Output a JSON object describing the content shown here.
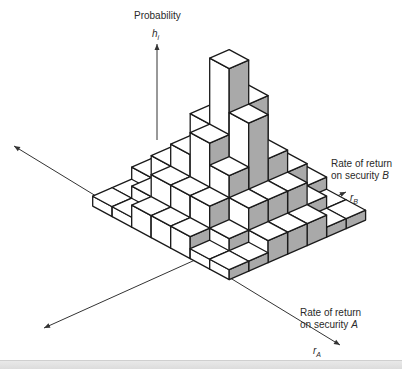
{
  "chart_data": {
    "type": "bar3d",
    "title": "",
    "z_axis": {
      "label": "Probability",
      "symbol": "h",
      "subscript": "i"
    },
    "x_axis": {
      "label_line1": "Rate of return",
      "label_line2_prefix": "on security ",
      "label_line2_var": "A",
      "symbol": "r",
      "subscript": "A"
    },
    "y_axis": {
      "label_line1": "Rate of return",
      "label_line2_prefix": "on security ",
      "label_line2_var": "B",
      "symbol": "r",
      "subscript": "B"
    },
    "grid_rows_rA": 7,
    "grid_cols_rB": 7,
    "heights": [
      [
        0,
        0,
        1,
        1,
        1,
        0,
        0
      ],
      [
        0,
        1,
        2,
        2,
        2,
        1,
        0
      ],
      [
        1,
        2,
        3,
        4,
        3,
        2,
        1
      ],
      [
        1,
        2,
        4,
        7,
        5,
        2,
        1
      ],
      [
        1,
        2,
        3,
        5,
        3,
        2,
        1
      ],
      [
        0,
        1,
        2,
        2,
        2,
        1,
        0
      ],
      [
        0,
        0,
        1,
        1,
        1,
        0,
        0
      ]
    ],
    "colors": {
      "top": "#ffffff",
      "left_face": "#ffffff",
      "right_face": "#a9a9a9",
      "edge": "#1a1a1a",
      "axis": "#333333"
    }
  }
}
